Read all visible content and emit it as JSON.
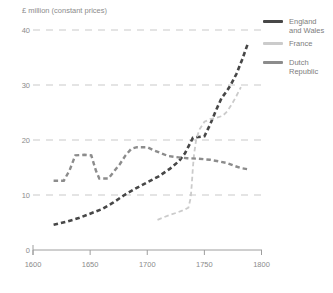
{
  "figure": {
    "background": "#ffffff",
    "text_color": "#8b8b8b",
    "gridline_color": "#c9c9c9",
    "axis_color": "#9e9e9e"
  },
  "chart_data": {
    "type": "line",
    "title": "",
    "ylabel": "£ million (constant prices)",
    "xlabel": "",
    "xlim": [
      1600,
      1800
    ],
    "ylim": [
      0,
      40
    ],
    "x_ticks": [
      1600,
      1650,
      1700,
      1750,
      1800
    ],
    "y_ticks": [
      0,
      10,
      20,
      30,
      40
    ],
    "grid": "horizontal dashed lines at 10, 20, 30, 40",
    "legend_position": "top-right",
    "line_style": "dashed",
    "series": [
      {
        "name": "England and Wales",
        "label_lines": [
          "England",
          "and Wales"
        ],
        "color": "#474747",
        "stroke_width": 2.6,
        "points": [
          [
            1618,
            4.6
          ],
          [
            1630,
            5.2
          ],
          [
            1640,
            5.8
          ],
          [
            1650,
            6.6
          ],
          [
            1660,
            7.4
          ],
          [
            1670,
            8.6
          ],
          [
            1680,
            10
          ],
          [
            1690,
            11.2
          ],
          [
            1700,
            12.3
          ],
          [
            1710,
            13.4
          ],
          [
            1720,
            14.8
          ],
          [
            1728,
            16.2
          ],
          [
            1733,
            17.6
          ],
          [
            1738,
            19.6
          ],
          [
            1740,
            20.4
          ],
          [
            1750,
            20.7
          ],
          [
            1755,
            22.8
          ],
          [
            1760,
            25.3
          ],
          [
            1765,
            27.6
          ],
          [
            1770,
            29
          ],
          [
            1773,
            30
          ],
          [
            1778,
            32
          ],
          [
            1783,
            34.6
          ],
          [
            1788,
            37.5
          ]
        ]
      },
      {
        "name": "France",
        "label_lines": [
          "France"
        ],
        "color": "#cbcbcb",
        "stroke_width": 1.8,
        "points": [
          [
            1709,
            5.5
          ],
          [
            1715,
            6
          ],
          [
            1720,
            6.4
          ],
          [
            1726,
            6.8
          ],
          [
            1731,
            7.2
          ],
          [
            1736,
            7.7
          ],
          [
            1738,
            9.5
          ],
          [
            1739,
            12
          ],
          [
            1740,
            15
          ],
          [
            1741,
            17.5
          ],
          [
            1743,
            20.3
          ],
          [
            1746,
            22
          ],
          [
            1750,
            23.3
          ],
          [
            1755,
            23.8
          ],
          [
            1760,
            24
          ],
          [
            1766,
            24.4
          ],
          [
            1770,
            25.2
          ],
          [
            1774,
            26.5
          ],
          [
            1778,
            28
          ],
          [
            1782,
            29.6
          ]
        ]
      },
      {
        "name": "Dutch Republic",
        "label_lines": [
          "Dutch",
          "Republic"
        ],
        "color": "#8c8c8c",
        "stroke_width": 2.4,
        "points": [
          [
            1618,
            12.6
          ],
          [
            1627,
            12.6
          ],
          [
            1632,
            14.5
          ],
          [
            1637,
            17.2
          ],
          [
            1645,
            17.3
          ],
          [
            1651,
            17.2
          ],
          [
            1655,
            14.5
          ],
          [
            1658,
            13
          ],
          [
            1666,
            13
          ],
          [
            1671,
            14.3
          ],
          [
            1676,
            15.6
          ],
          [
            1681,
            17.2
          ],
          [
            1686,
            18.4
          ],
          [
            1691,
            18.7
          ],
          [
            1700,
            18.7
          ],
          [
            1706,
            18.1
          ],
          [
            1712,
            17.6
          ],
          [
            1718,
            17.1
          ],
          [
            1725,
            16.9
          ],
          [
            1735,
            16.7
          ],
          [
            1745,
            16.6
          ],
          [
            1755,
            16.4
          ],
          [
            1763,
            16.1
          ],
          [
            1770,
            15.8
          ],
          [
            1776,
            15.3
          ],
          [
            1782,
            14.9
          ],
          [
            1788,
            14.7
          ]
        ]
      }
    ]
  },
  "legend": {
    "items_top_px": [
      17,
      39,
      58
    ]
  }
}
